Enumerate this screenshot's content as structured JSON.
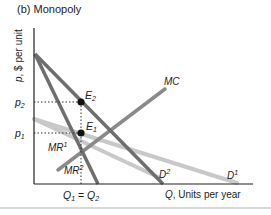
{
  "title": "(b) Monopoly",
  "axes": {
    "y_label_var": "p",
    "y_label_rest": ", $ per unit",
    "x_label_var": "Q",
    "x_label_rest": ", Units per year",
    "x_tick": {
      "q1": "Q",
      "q1_sub": "1",
      "eq": " = ",
      "q2": "Q",
      "q2_sub": "2"
    },
    "y_ticks": [
      {
        "name": "p",
        "sub": "2"
      },
      {
        "name": "p",
        "sub": "1"
      }
    ]
  },
  "curves": {
    "mc": {
      "label": "MC"
    },
    "d1": {
      "label": "D",
      "sup": "1"
    },
    "d2": {
      "label": "D",
      "sup": "2"
    },
    "mr1": {
      "label": "MR",
      "sup": "1"
    },
    "mr2": {
      "label": "MR",
      "sup": "2"
    }
  },
  "points": {
    "e1": {
      "label": "E",
      "sub": "1"
    },
    "e2": {
      "label": "E",
      "sub": "2"
    }
  },
  "colors": {
    "dark_line": "#6e6e6e",
    "light_line": "#c4c4c4",
    "mc_line": "#8a8a8a",
    "axis": "#222222",
    "point": "#111111"
  }
}
